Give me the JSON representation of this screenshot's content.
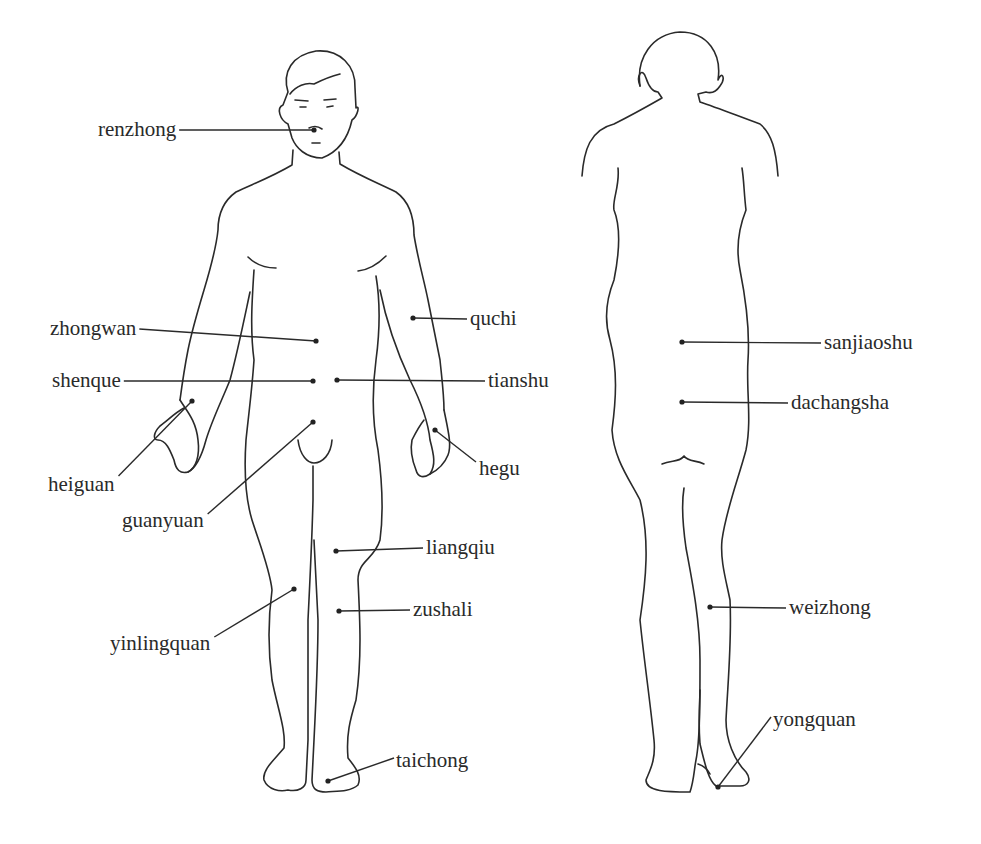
{
  "diagram": {
    "colors": {
      "ink": "#2a2a2a",
      "background": "#ffffff"
    },
    "front_view": {
      "name": "front",
      "points": [
        {
          "label": "renzhong",
          "dot": [
            314,
            130
          ],
          "label_pos": [
            98,
            119
          ],
          "side": "left"
        },
        {
          "label": "zhongwan",
          "dot": [
            316,
            341
          ],
          "label_pos": [
            50,
            318
          ],
          "side": "left"
        },
        {
          "label": "shenque",
          "dot": [
            313,
            381
          ],
          "label_pos": [
            52,
            370
          ],
          "side": "left"
        },
        {
          "label": "heiguan",
          "dot": [
            192,
            401
          ],
          "label_pos": [
            48,
            474
          ],
          "side": "left"
        },
        {
          "label": "guanyuan",
          "dot": [
            313,
            422
          ],
          "label_pos": [
            122,
            510
          ],
          "side": "left"
        },
        {
          "label": "yinlingquan",
          "dot": [
            294,
            589
          ],
          "label_pos": [
            110,
            633
          ],
          "side": "left"
        },
        {
          "label": "quchi",
          "dot": [
            413,
            318
          ],
          "label_pos": [
            470,
            308
          ],
          "side": "right"
        },
        {
          "label": "tianshu",
          "dot": [
            337,
            380
          ],
          "label_pos": [
            488,
            370
          ],
          "side": "right"
        },
        {
          "label": "hegu",
          "dot": [
            435,
            430
          ],
          "label_pos": [
            479,
            458
          ],
          "side": "right"
        },
        {
          "label": "liangqiu",
          "dot": [
            336,
            551
          ],
          "label_pos": [
            426,
            537
          ],
          "side": "right"
        },
        {
          "label": "zushali",
          "dot": [
            339,
            611
          ],
          "label_pos": [
            413,
            599
          ],
          "side": "right"
        },
        {
          "label": "taichong",
          "dot": [
            328,
            781
          ],
          "label_pos": [
            396,
            750
          ],
          "side": "right"
        }
      ]
    },
    "back_view": {
      "name": "back",
      "points": [
        {
          "label": "sanjiaoshu",
          "dot": [
            682,
            342
          ],
          "label_pos": [
            824,
            332
          ],
          "side": "right"
        },
        {
          "label": "dachangsha",
          "dot": [
            682,
            402
          ],
          "label_pos": [
            791,
            392
          ],
          "side": "right"
        },
        {
          "label": "weizhong",
          "dot": [
            710,
            607
          ],
          "label_pos": [
            789,
            597
          ],
          "side": "right"
        },
        {
          "label": "yongquan",
          "dot": [
            718,
            787
          ],
          "label_pos": [
            773,
            709
          ],
          "side": "right"
        }
      ]
    }
  }
}
